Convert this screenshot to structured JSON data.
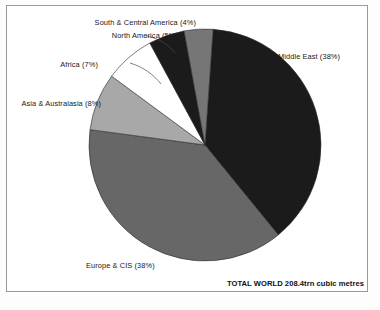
{
  "figure": {
    "frame_color": "#9a9a9a",
    "background": "#ffffff"
  },
  "total_note": "TOTAL WORLD 208.4trn cubic metres",
  "chart_data": {
    "type": "pie",
    "title": "",
    "subtitle": "",
    "xlabel": "",
    "ylabel": "",
    "units": "trn cubic metres",
    "total_label": "TOTAL WORLD 208.4trn cubic metres",
    "total_value": 208.4,
    "legend": "none",
    "labels_position": "outside-with-leader-lines",
    "start_angle_deg": 4,
    "direction": "clockwise",
    "categories": [
      "Middle East",
      "Europe & CIS",
      "Asia & Australasia",
      "Africa",
      "North America",
      "South & Central America"
    ],
    "values": [
      38,
      38,
      8,
      7,
      5,
      4
    ],
    "colors": [
      "#1b1b1b",
      "#676767",
      "#a8a8a8",
      "#ffffff",
      "#1b1b1b",
      "#767676"
    ],
    "slices": [
      {
        "name": "Middle East",
        "percent": 38,
        "label": "Middle East (38%)",
        "color": "#1b1b1b",
        "start_angle_deg": 4,
        "end_angle_deg": 140.8,
        "label_x": 278,
        "label_y": 52,
        "label_align": "left"
      },
      {
        "name": "Europe & CIS",
        "percent": 38,
        "label": "Europe & CIS (38%)",
        "color": "#676767",
        "start_angle_deg": 140.8,
        "end_angle_deg": 277.6,
        "label_x": 86,
        "label_y": 261,
        "label_align": "left"
      },
      {
        "name": "Asia & Australasia",
        "percent": 8,
        "label": "Asia & Australasia (8%)",
        "color": "#a8a8a8",
        "start_angle_deg": 277.6,
        "end_angle_deg": 306.4,
        "label_x": 101,
        "label_y": 99,
        "label_align": "right"
      },
      {
        "name": "Africa",
        "percent": 7,
        "label": "Africa (7%)",
        "color": "#ffffff",
        "start_angle_deg": 306.4,
        "end_angle_deg": 331.6,
        "label_x": 98,
        "label_y": 60,
        "label_align": "right"
      },
      {
        "name": "North America",
        "percent": 5,
        "label": "North America (5%)",
        "color": "#1b1b1b",
        "start_angle_deg": 331.6,
        "end_angle_deg": 349.6,
        "label_x": 178,
        "label_y": 31,
        "label_align": "right"
      },
      {
        "name": "South & Central America",
        "percent": 4,
        "label": "South & Central America (4%)",
        "color": "#767676",
        "start_angle_deg": 349.6,
        "end_angle_deg": 364,
        "label_x": 196,
        "label_y": 18,
        "label_align": "right"
      }
    ]
  }
}
